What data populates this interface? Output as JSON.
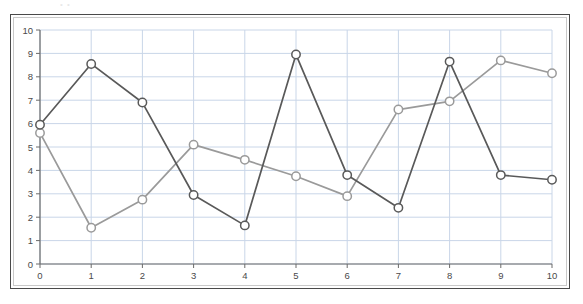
{
  "scan": {
    "artifact_text": "•  •"
  },
  "chart_data": {
    "type": "line",
    "title": "",
    "subtitle": "",
    "xlabel": "",
    "ylabel": "",
    "xlim": [
      0,
      10
    ],
    "ylim": [
      0,
      10
    ],
    "grid": true,
    "legend_position": "none",
    "x": [
      0,
      1,
      2,
      3,
      4,
      5,
      6,
      7,
      8,
      9,
      10
    ],
    "x_tick_labels": [
      "0",
      "1",
      "2",
      "3",
      "4",
      "5",
      "6",
      "7",
      "8",
      "9",
      "10"
    ],
    "y_ticks": [
      0,
      1,
      2,
      3,
      4,
      5,
      6,
      7,
      8,
      9,
      10
    ],
    "y_tick_labels": [
      "0",
      "1",
      "2",
      "3",
      "4",
      "5",
      "6",
      "7",
      "8",
      "9",
      "10"
    ],
    "marker": "open-circle",
    "series": [
      {
        "name": "Series 1",
        "color": "#595959",
        "values": [
          5.95,
          8.55,
          6.9,
          2.95,
          1.65,
          8.95,
          3.8,
          2.4,
          8.65,
          3.8,
          3.6
        ]
      },
      {
        "name": "Series 2",
        "color": "#9a9a9a",
        "values": [
          5.6,
          1.55,
          2.75,
          5.1,
          4.45,
          3.75,
          2.9,
          6.6,
          6.95,
          8.7,
          8.15
        ]
      }
    ],
    "colors": {
      "grid": "#c9d6e8",
      "axis": "#6b6b6b",
      "frame_outer": "#4a4a4a",
      "frame_inner": "#c9c9c9",
      "background": "#ffffff",
      "tick_text": "#4a4a4a"
    }
  }
}
